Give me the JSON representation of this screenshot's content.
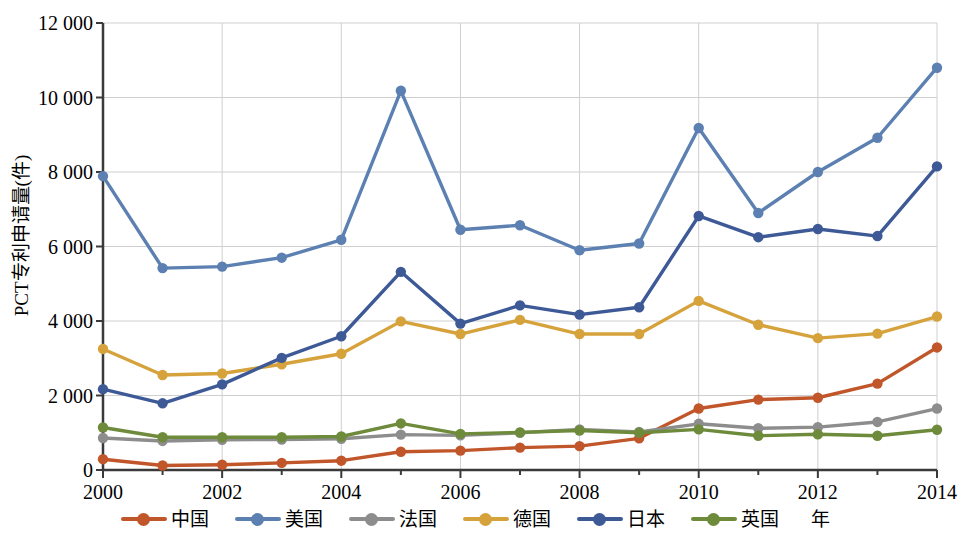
{
  "chart_data": {
    "type": "line",
    "title": "",
    "xlabel": "年",
    "ylabel": "PCT专利申请量(件)",
    "x": [
      2000,
      2001,
      2002,
      2003,
      2004,
      2005,
      2006,
      2007,
      2008,
      2009,
      2010,
      2011,
      2012,
      2013,
      2014
    ],
    "xtick_labels": [
      "2000",
      "2002",
      "2004",
      "2006",
      "2008",
      "2010",
      "2012",
      "2014"
    ],
    "xtick_values": [
      2000,
      2002,
      2004,
      2006,
      2008,
      2010,
      2012,
      2014
    ],
    "ytick_labels": [
      "0",
      "2 000",
      "4 000",
      "6 000",
      "8 000",
      "10 000",
      "12 000"
    ],
    "ytick_values": [
      0,
      2000,
      4000,
      6000,
      8000,
      10000,
      12000
    ],
    "xlim": [
      2000,
      2014
    ],
    "ylim": [
      0,
      12000
    ],
    "grid": true,
    "legend_position": "bottom",
    "series": [
      {
        "name": "中国",
        "color": "#C0562A",
        "values": [
          290,
          120,
          140,
          190,
          250,
          490,
          520,
          600,
          640,
          850,
          1650,
          1890,
          1940,
          2320,
          3290
        ]
      },
      {
        "name": "美国",
        "color": "#5C80B1",
        "values": [
          7890,
          5420,
          5460,
          5700,
          6180,
          10180,
          6450,
          6570,
          5900,
          6080,
          9180,
          6900,
          8000,
          8920,
          10800
        ]
      },
      {
        "name": "法国",
        "color": "#8D8D8D",
        "values": [
          860,
          780,
          810,
          820,
          840,
          950,
          930,
          1000,
          1090,
          1020,
          1240,
          1120,
          1150,
          1290,
          1650
        ]
      },
      {
        "name": "德国",
        "color": "#D6A23B",
        "values": [
          3250,
          2550,
          2590,
          2840,
          3120,
          3990,
          3650,
          4030,
          3650,
          3650,
          4540,
          3900,
          3540,
          3660,
          4120
        ]
      },
      {
        "name": "日本",
        "color": "#3D5A97",
        "values": [
          2170,
          1790,
          2300,
          3010,
          3590,
          5320,
          3930,
          4420,
          4170,
          4370,
          6820,
          6250,
          6470,
          6280,
          8150
        ]
      },
      {
        "name": "英国",
        "color": "#6E8B3C",
        "values": [
          1140,
          880,
          880,
          880,
          900,
          1250,
          970,
          1010,
          1060,
          1000,
          1090,
          920,
          960,
          920,
          1080
        ]
      }
    ]
  },
  "axes": {
    "y_title": "PCT专利申请量(件)",
    "x_title": "年"
  }
}
